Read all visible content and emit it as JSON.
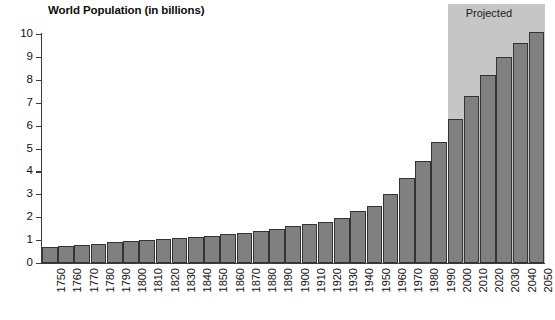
{
  "chart": {
    "title": "World Population (in billions)",
    "projected_label": "Projected",
    "y_axis": {
      "ticks": [
        "0",
        "1",
        "2",
        "3",
        "4",
        "5",
        "6",
        "7",
        "8",
        "9",
        "10"
      ]
    }
  },
  "chart_data": {
    "type": "bar",
    "title": "World Population (in billions)",
    "xlabel": "",
    "ylabel": "Population (billions)",
    "ylim": [
      0,
      10
    ],
    "grid": false,
    "legend": false,
    "annotations": [
      {
        "text": "Projected",
        "from_category": "2000",
        "to_category": "2050",
        "note": "shaded gray band covering projected years"
      }
    ],
    "bar_color": "#808080",
    "bar_edge_color": "#333333",
    "projected_band_color": "#c6c6c6",
    "categories": [
      "1750",
      "1760",
      "1770",
      "1780",
      "1790",
      "1800",
      "1810",
      "1820",
      "1830",
      "1840",
      "1850",
      "1860",
      "1870",
      "1880",
      "1890",
      "1900",
      "1910",
      "1920",
      "1930",
      "1940",
      "1950",
      "1960",
      "1970",
      "1980",
      "1990",
      "2000",
      "2010",
      "2020",
      "2030",
      "2040",
      "2050"
    ],
    "values": [
      0.7,
      0.75,
      0.8,
      0.85,
      0.9,
      0.95,
      1.0,
      1.05,
      1.1,
      1.15,
      1.2,
      1.27,
      1.33,
      1.4,
      1.49,
      1.6,
      1.7,
      1.8,
      1.95,
      2.25,
      2.5,
      3.0,
      3.7,
      4.45,
      5.3,
      6.3,
      7.3,
      8.2,
      9.0,
      9.6,
      10.1
    ],
    "projected_from": "2000"
  }
}
